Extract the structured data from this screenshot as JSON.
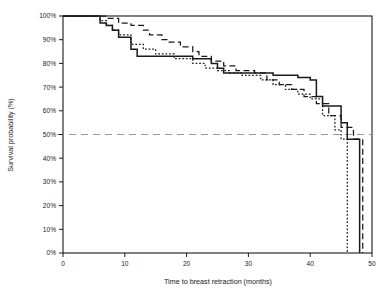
{
  "chart_data": {
    "type": "line",
    "subtype": "kaplan-meier-step",
    "title": "",
    "xlabel": "Time to breast retraction (months)",
    "ylabel": "Survival probability (%)",
    "xlim": [
      0,
      50
    ],
    "ylim": [
      0,
      100
    ],
    "xticks": [
      0,
      10,
      20,
      30,
      40,
      50
    ],
    "xtick_labels": [
      "0",
      "10",
      "20",
      "30",
      "40",
      "50"
    ],
    "yticks": [
      0,
      10,
      20,
      30,
      40,
      50,
      60,
      70,
      80,
      90,
      100
    ],
    "ytick_labels": [
      "0%",
      "10%",
      "20%",
      "30%",
      "40%",
      "50%",
      "60%",
      "70%",
      "80%",
      "90%",
      "100%"
    ],
    "grid": false,
    "legend": "none",
    "frame": "box",
    "reference_lines": [
      {
        "name": "median-survival-reference",
        "orientation": "horizontal",
        "value": 50,
        "label": "50%",
        "style": "dashed",
        "color": "#9a9a9a"
      }
    ],
    "series": [
      {
        "name": "Solid curve",
        "style": "solid",
        "color": "#1a1a1a",
        "x": [
          0,
          5,
          6,
          7,
          8,
          9,
          11,
          12,
          17,
          21,
          24,
          25,
          26,
          30,
          33,
          34,
          38,
          40,
          41,
          42,
          45,
          46,
          48
        ],
        "values": [
          100,
          100,
          97,
          96,
          94,
          91,
          86,
          83,
          83,
          82,
          80,
          78,
          76,
          76,
          76,
          75,
          74,
          73,
          66,
          62,
          55,
          48,
          0
        ]
      },
      {
        "name": "Long-dashed curve",
        "style": "dashed",
        "color": "#1a1a1a",
        "x": [
          0,
          6,
          7,
          9,
          11,
          13,
          14,
          16,
          17,
          19,
          21,
          22,
          24,
          26,
          28,
          31,
          33,
          35,
          37,
          39,
          41,
          43,
          45,
          47,
          48.5
        ],
        "values": [
          100,
          100,
          99,
          97,
          96,
          94,
          92,
          90,
          89,
          87,
          85,
          83,
          81,
          79,
          77,
          76,
          73,
          71,
          69,
          66,
          63,
          58,
          53,
          48,
          0
        ]
      },
      {
        "name": "Short-dotted curve",
        "style": "dotted",
        "color": "#1a1a1a",
        "x": [
          0,
          5,
          6,
          7,
          8,
          9,
          11,
          13,
          15,
          18,
          21,
          23,
          25,
          27,
          29,
          32,
          34,
          36,
          38,
          40,
          42,
          44,
          45,
          46
        ],
        "values": [
          100,
          100,
          98,
          96,
          94,
          92,
          88,
          86,
          84,
          82,
          80,
          78,
          77,
          76,
          75,
          73,
          71,
          69,
          67,
          65,
          58,
          52,
          48,
          0
        ]
      }
    ]
  }
}
